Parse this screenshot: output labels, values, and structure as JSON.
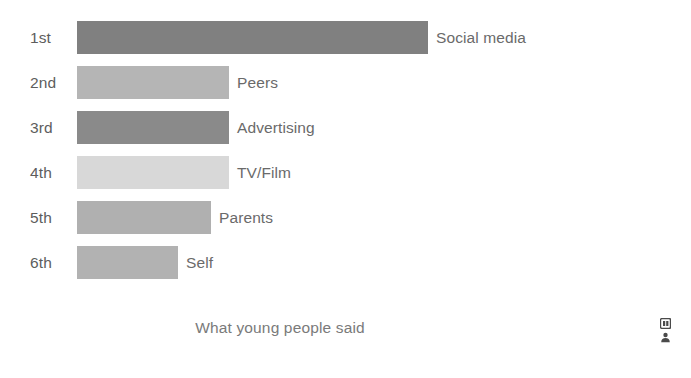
{
  "chart_data": {
    "type": "bar",
    "orientation": "horizontal",
    "title": "",
    "caption": "What young people said",
    "xlabel": "",
    "ylabel": "",
    "grid": false,
    "legend": false,
    "axis_visible": false,
    "categories": [
      "1st",
      "2nd",
      "3rd",
      "4th",
      "5th",
      "6th"
    ],
    "bar_labels": [
      "Social media",
      "Peers",
      "Advertising",
      "TV/Film",
      "Parents",
      "Self"
    ],
    "values": [
      351,
      152,
      152,
      152,
      134,
      101
    ],
    "value_unit": "relative bar length (px)",
    "xlim": [
      0,
      351
    ],
    "bars": [
      {
        "rank": "1st",
        "label": "Social media",
        "value": 351,
        "color": "#808080"
      },
      {
        "rank": "2nd",
        "label": "Peers",
        "value": 152,
        "color": "#b5b5b5"
      },
      {
        "rank": "3rd",
        "label": "Advertising",
        "value": 152,
        "color": "#8a8a8a"
      },
      {
        "rank": "4th",
        "label": "TV/Film",
        "value": 152,
        "color": "#d8d8d8"
      },
      {
        "rank": "5th",
        "label": "Parents",
        "value": 134,
        "color": "#b0b0b0"
      },
      {
        "rank": "6th",
        "label": "Self",
        "value": 101,
        "color": "#b2b2b2"
      }
    ]
  },
  "colors": {
    "background": "#ffffff",
    "rank_text": "#5d5d5d",
    "label_text": "#6a6a6a",
    "caption_text": "#7a7a7a",
    "icon": "#4a4a4a"
  },
  "icons": {
    "top": "image-thumbnail-icon",
    "bottom": "person-icon"
  }
}
